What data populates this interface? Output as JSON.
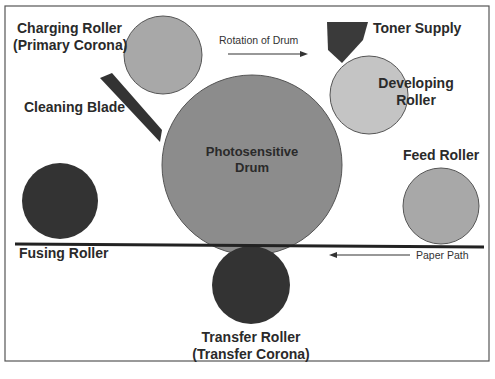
{
  "diagram": {
    "labels": {
      "charging_roller_line1": "Charging Roller",
      "charging_roller_line2": "(Primary Corona)",
      "rotation": "Rotation of Drum",
      "toner_supply": "Toner Supply",
      "developing_line1": "Developing",
      "developing_line2": "Roller",
      "cleaning_blade": "Cleaning Blade",
      "drum_line1": "Photosensitive",
      "drum_line2": "Drum",
      "feed_roller": "Feed Roller",
      "fusing_roller": "Fusing Roller",
      "paper_path": "Paper Path",
      "transfer_line1": "Transfer Roller",
      "transfer_line2": "(Transfer Corona)"
    },
    "colors": {
      "drum": "#8c8c8c",
      "charging_roller": "#a8a8a8",
      "developing_roller": "#c4c4c4",
      "feed_roller": "#a8a8a8",
      "fusing_roller": "#333333",
      "transfer_roller": "#333333",
      "toner_supply": "#3a3a3a",
      "cleaning_blade": "#333333",
      "paper_line": "#222222"
    }
  }
}
